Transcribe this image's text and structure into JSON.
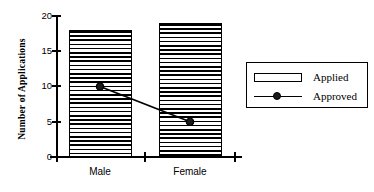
{
  "chart_data": {
    "type": "bar",
    "title": "",
    "subtitle": "",
    "xlabel": "",
    "ylabel": "Number of Applications",
    "categories": [
      "Male",
      "Female"
    ],
    "ylim": [
      0,
      20
    ],
    "yticks": [
      0,
      5,
      10,
      15,
      20
    ],
    "ytick_labels": [
      "0",
      "5",
      "10",
      "15",
      "20"
    ],
    "grid": false,
    "legend_position": "right",
    "series": [
      {
        "name": "Applied",
        "type": "bar",
        "values": [
          18,
          19
        ],
        "fill": "horizontal-hatch",
        "edge_color": "#000000"
      },
      {
        "name": "Approved",
        "type": "line",
        "values": [
          10,
          5
        ],
        "marker": "filled-circle",
        "line_color": "#000000"
      }
    ],
    "annotations": []
  },
  "axes": {
    "y_title": "Number of Applications",
    "tick_0": "0",
    "tick_5": "5",
    "tick_10": "10",
    "tick_15": "15",
    "tick_20": "20",
    "cat_male": "Male",
    "cat_female": "Female"
  },
  "legend": {
    "items": [
      {
        "label": "Applied",
        "swatch": "bar-hatch-swatch"
      },
      {
        "label": "Approved",
        "swatch": "line-marker-swatch"
      }
    ]
  }
}
